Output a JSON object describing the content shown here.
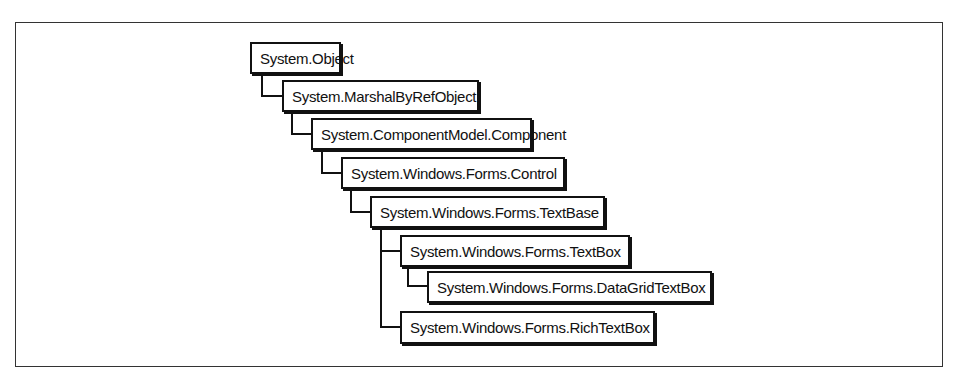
{
  "diagram": {
    "type": "class-inheritance-hierarchy",
    "nodes": [
      {
        "id": "object",
        "label": "System.Object",
        "parent": null
      },
      {
        "id": "marshal",
        "label": "System.MarshalByRefObject",
        "parent": "object"
      },
      {
        "id": "component",
        "label": "System.ComponentModel.Component",
        "parent": "marshal"
      },
      {
        "id": "control",
        "label": "System.Windows.Forms.Control",
        "parent": "component"
      },
      {
        "id": "textbase",
        "label": "System.Windows.Forms.TextBase",
        "parent": "control"
      },
      {
        "id": "textbox",
        "label": "System.Windows.Forms.TextBox",
        "parent": "textbase"
      },
      {
        "id": "datagridtextbox",
        "label": "System.Windows.Forms.DataGridTextBox",
        "parent": "textbox"
      },
      {
        "id": "richtextbox",
        "label": "System.Windows.Forms.RichTextBox",
        "parent": "textbase"
      }
    ]
  }
}
